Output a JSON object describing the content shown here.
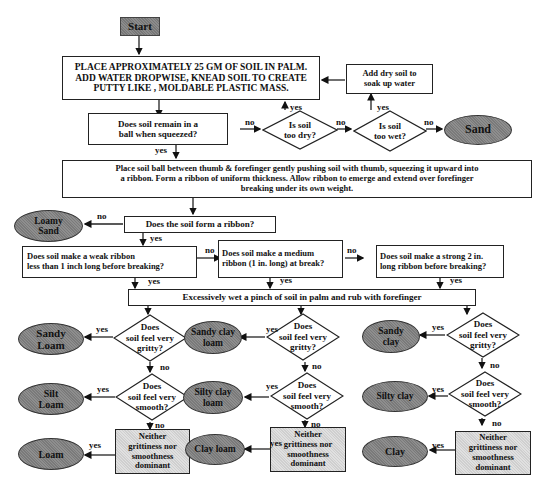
{
  "start": "Start",
  "step1": [
    "PLACE APPROXIMATELY 25 GM OF SOIL IN PALM.",
    "ADD WATER DROPWISE, KNEAD SOIL TO CREATE",
    "PUTTY LIKE , MOLDABLE PLASTIC MASS."
  ],
  "add_dry": [
    "Add dry soil to",
    "soak up water"
  ],
  "ball_q": [
    "Does soil remain in a",
    "ball when squeezed?"
  ],
  "too_dry": [
    "Is soil",
    "too dry?"
  ],
  "too_wet": [
    "Is soil",
    "too wet?"
  ],
  "sand": "Sand",
  "ribbon_step": [
    "Place soil ball between thumb & forefinger gently pushing soil with thumb, squeezing it upward into",
    "a ribbon. Form a ribbon of uniform thickness. Allow ribbon to emerge and extend over forefinger",
    "breaking under its own weight."
  ],
  "form_ribbon_q": "Does the soil form a ribbon?",
  "loamy_sand": [
    "Loamy",
    "Sand"
  ],
  "weak_q": [
    "Does soil make a weak ribbon",
    "less than 1 inch long before breaking?"
  ],
  "medium_q": [
    "Does soil make a medium",
    "ribbon (1 in. long) at break?"
  ],
  "strong_q": [
    "Does soil make a strong 2 in.",
    "long ribbon before breaking?"
  ],
  "wet_step": "Excessively wet a pinch of soil in palm and rub with forefinger",
  "gritty_q": [
    "Does",
    "soil feel very",
    "gritty?"
  ],
  "smooth_q": [
    "Does",
    "soil feel very",
    "smooth?"
  ],
  "neither": [
    "Neither",
    "grittiness nor",
    "smoothness",
    "dominant"
  ],
  "columns": [
    {
      "gritty": [
        "Sandy",
        "Loam"
      ],
      "smooth": [
        "Silt",
        "Loam"
      ],
      "neither": [
        "Loam"
      ]
    },
    {
      "gritty": [
        "Sandy clay",
        "loam"
      ],
      "smooth": [
        "Silty clay",
        "loam"
      ],
      "neither": [
        "Clay loam"
      ]
    },
    {
      "gritty": [
        "Sandy",
        "clay"
      ],
      "smooth": [
        "Silty clay"
      ],
      "neither": [
        "Clay"
      ]
    }
  ],
  "labels": {
    "yes": "yes",
    "no": "no"
  }
}
